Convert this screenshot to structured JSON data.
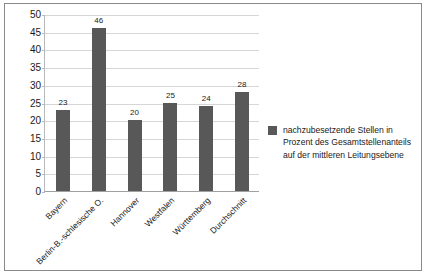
{
  "chart_data": {
    "type": "bar",
    "title": "",
    "subtitle": "",
    "xlabel": "",
    "ylabel": "",
    "ylim": [
      0,
      50
    ],
    "ytick_step": 5,
    "grid": true,
    "legend_position": "right",
    "categories": [
      "Bayern",
      "Berlin-B.-schlesische O.",
      "Hannover",
      "Westfalen",
      "Württemberg",
      "Durchschnitt"
    ],
    "values": [
      23,
      46,
      20,
      25,
      24,
      28
    ],
    "yticks": [
      "0",
      "5",
      "10",
      "15",
      "20",
      "25",
      "30",
      "35",
      "40",
      "45",
      "50"
    ],
    "series": [
      {
        "name": "nachzubesetzende Stellen in Prozent des Gesamtstellenanteils auf der mittleren Leitungsebene",
        "values": [
          23,
          46,
          20,
          25,
          24,
          28
        ],
        "color": "#585858"
      }
    ],
    "legend": {
      "swatch_color": "#585858",
      "lines": [
        "nachzubesetzende Stellen in",
        "Prozent des Gesamtstellenanteils",
        "auf der mittleren Leitungsebene"
      ]
    }
  },
  "colors": {
    "bar": "#585858",
    "grid": "#d6d6d6",
    "axis": "#a0a0a0",
    "frame": "#8a8a8a",
    "text": "#1a1a1a",
    "background": "#ffffff"
  }
}
